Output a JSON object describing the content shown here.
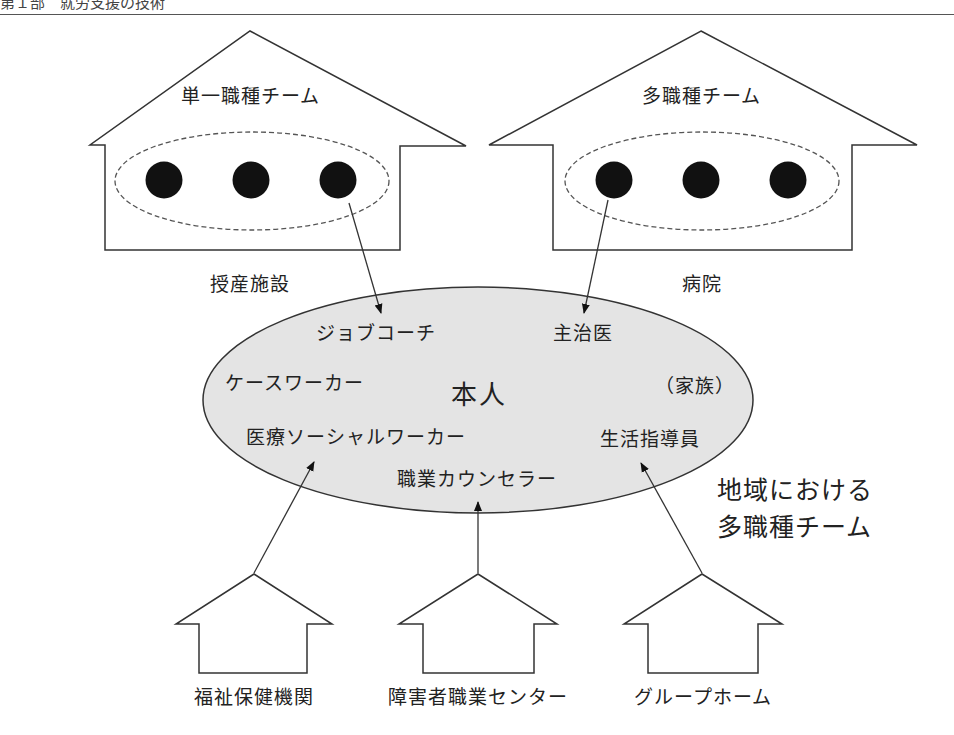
{
  "header": {
    "text": "第１部　就労支援の技術"
  },
  "top_houses": [
    {
      "team_label": "単一職種チーム",
      "facility_label": "授産施設",
      "members": 3
    },
    {
      "team_label": "多職種チーム",
      "facility_label": "病院",
      "members": 3
    }
  ],
  "center": {
    "person": "本人",
    "roles": {
      "job_coach": "ジョブコーチ",
      "attending_physician": "主治医",
      "case_worker": "ケースワーカー",
      "family": "（家族）",
      "medical_social_worker": "医療ソーシャルワーカー",
      "life_instructor": "生活指導員",
      "vocational_counselor": "職業カウンセラー"
    }
  },
  "region_label": {
    "line1": "地域における",
    "line2": "多職種チーム"
  },
  "bottom_houses": [
    {
      "label": "福祉保健機関"
    },
    {
      "label": "障害者職業センター"
    },
    {
      "label": "グループホーム"
    }
  ],
  "colors": {
    "line": "#333333",
    "ellipse_fill": "#e4e4e4",
    "member_dot": "#111111",
    "dashed": "#555555"
  }
}
